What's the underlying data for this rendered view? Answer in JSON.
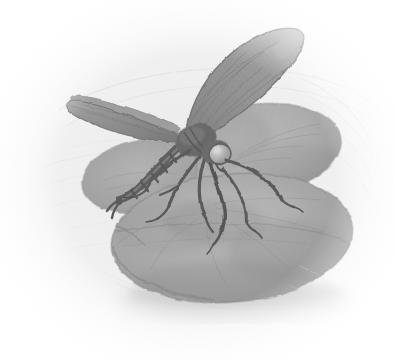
{
  "artwork": {
    "title": "Dragonfly Resting on Lily Pads",
    "medium": "graphite pencil drawing",
    "palette": "grayscale",
    "orientation": "landscape",
    "width": 394,
    "height": 360,
    "background_color": "#ffffff",
    "paper_tone": "#f2f2f2",
    "vignette": "soft white fade at all four edges"
  },
  "colors": {
    "paper_white": "#ffffff",
    "paper_tint": "#f0f0f0",
    "water_light": "#e6e6e6",
    "water_mid": "#d8d8d8",
    "pad_light": "#9a9a9a",
    "pad_mid": "#848484",
    "pad_dark": "#6a6a6a",
    "pad_rim": "#525252",
    "wing_light": "#8f8f8f",
    "wing_mid": "#6e6e6e",
    "wing_dark": "#4a4a4a",
    "body_dark": "#2a2a2a",
    "leg_black": "#1a1a1a",
    "ripple_line": "#c6c6c6",
    "shadow": "#b8b8b8"
  },
  "subjects": [
    {
      "name": "dragonfly",
      "description": "large dragonfly perched centrally, wings raised and swept up-right, abdomen trailing to the lower-left, six dark spindly legs gripping the lily pad",
      "tone": "darkest element in the composition",
      "parts": [
        {
          "name": "upper-wing-pair",
          "direction": "upper right",
          "tone": "#6e6e6e",
          "texture": "mottled vein hatching"
        },
        {
          "name": "lower-wing-pair",
          "direction": "upper left",
          "tone": "#5a5a5a",
          "texture": "narrow tapered blade"
        },
        {
          "name": "thorax",
          "tone": "#2a2a2a"
        },
        {
          "name": "head",
          "tone": "#3a3a3a"
        },
        {
          "name": "compound-eye",
          "tone": "#9a9a9a",
          "note": "large rounded highlight"
        },
        {
          "name": "abdomen",
          "direction": "down and left",
          "tone": "#1f1f1f",
          "note": "segmented with visible joints"
        },
        {
          "name": "legs",
          "count": 6,
          "tone": "#1a1a1a",
          "note": "thin angular, splayed over pad surface"
        }
      ]
    },
    {
      "name": "lily-pad-front",
      "description": "large oval lily pad occupying the lower half, slightly tilted, with a notch at the left and soft radial veining",
      "tone": "#848484",
      "position": "lower center-right"
    },
    {
      "name": "lily-pad-back",
      "description": "second lily pad behind and to the upper right, partly overlapped by the front pad and the dragonfly",
      "tone": "#8e8e8e",
      "position": "upper right"
    },
    {
      "name": "lily-pad-left",
      "description": "small sliver of a third pad peeking out to the left behind the dragonfly abdomen",
      "tone": "#7e7e7e",
      "position": "middle left"
    },
    {
      "name": "water-surface",
      "description": "pale water with faint concentric ripple arcs radiating outward, strongest to the upper right and lower right",
      "tone": "#e8e8e8"
    }
  ],
  "annotations": {
    "ripple_count": 9,
    "pad_count": 3,
    "leg_count": 6,
    "wing_count": 4
  }
}
